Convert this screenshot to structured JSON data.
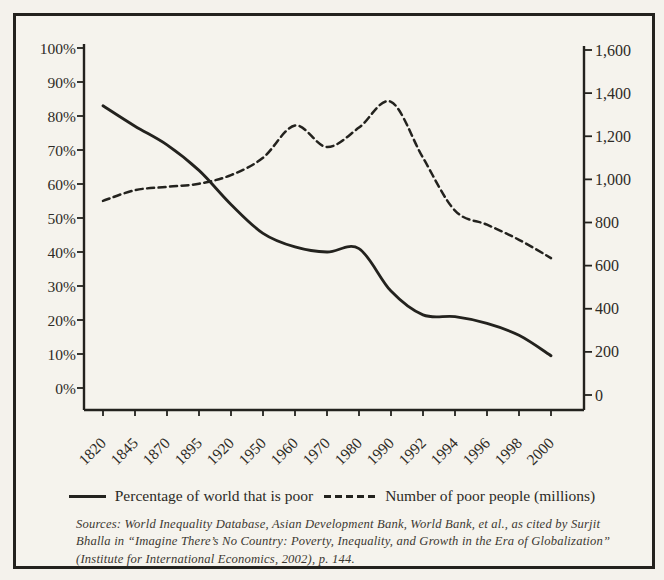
{
  "chart_data": {
    "type": "line",
    "title": "",
    "categories": [
      "1820",
      "1845",
      "1870",
      "1895",
      "1920",
      "1950",
      "1960",
      "1970",
      "1980",
      "1990",
      "1992",
      "1994",
      "1996",
      "1998",
      "2000"
    ],
    "series": [
      {
        "name": "Percentage of world that is poor",
        "style": "solid",
        "axis": "left",
        "values": [
          83,
          77,
          71.5,
          64,
          54,
          45.5,
          41.5,
          40,
          41,
          28.5,
          21.5,
          21,
          19,
          15.5,
          9.5
        ]
      },
      {
        "name": "Number of poor people (millions)",
        "style": "dashed",
        "axis": "right",
        "values": [
          900,
          950,
          965,
          980,
          1020,
          1100,
          1250,
          1150,
          1240,
          1360,
          1100,
          855,
          790,
          720,
          635
        ]
      }
    ],
    "left_axis": {
      "ticks": [
        "100%",
        "90%",
        "80%",
        "70%",
        "60%",
        "50%",
        "40%",
        "30%",
        "20%",
        "10%",
        "0%"
      ],
      "min": 0,
      "max": 100
    },
    "right_axis": {
      "ticks": [
        "1,600",
        "1,400",
        "1,200",
        "1,000",
        "800",
        "600",
        "400",
        "200",
        "0"
      ],
      "min": 0,
      "max": 1600
    },
    "grid": false,
    "legend_position": "bottom"
  },
  "legend": {
    "series1_label": "Percentage of world that is poor",
    "series2_label": "Number of poor people (millions)"
  },
  "sources": {
    "line1": "Sources: World Inequality Database, Asian Development Bank, World Bank, et al., as cited by Surjit",
    "line2": "Bhalla in “Imagine There’s No Country: Poverty, Inequality, and Growth in the Era of Globalization”",
    "line3": "(Institute for International Economics, 2002), p. 144."
  },
  "colors": {
    "ink": "#23221e",
    "label_text": "#2e2b26",
    "paper": "#f4f2ec"
  }
}
